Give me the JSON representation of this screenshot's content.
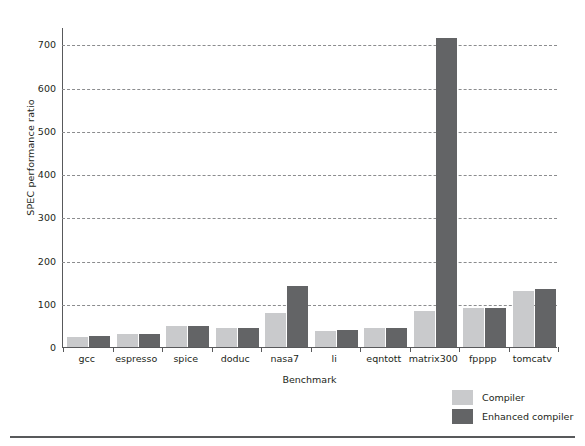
{
  "chart_data": {
    "type": "bar",
    "title": "",
    "xlabel": "Benchmark",
    "ylabel": "SPEC performance ratio",
    "categories": [
      "gcc",
      "espresso",
      "spice",
      "doduc",
      "nasa7",
      "li",
      "eqntott",
      "matrix300",
      "fpppp",
      "tomcatv"
    ],
    "series": [
      {
        "name": "Compiler",
        "color": "#c9cacc",
        "values": [
          24,
          30,
          49,
          44,
          78,
          38,
          43,
          84,
          90,
          130
        ]
      },
      {
        "name": "Enhanced compiler",
        "color": "#636466",
        "values": [
          25,
          29,
          49,
          45,
          142,
          39,
          45,
          715,
          90,
          135
        ]
      }
    ],
    "ylim": [
      0,
      700
    ],
    "yticks": [
      0,
      100,
      200,
      300,
      400,
      500,
      600,
      700
    ],
    "ytick_labels": [
      "0",
      "100",
      "200",
      "300",
      "400",
      "500",
      "600",
      "700"
    ],
    "grid": "horizontal-dashed",
    "legend_position": "bottom-right",
    "ymax_render": 740
  },
  "legend": {
    "items": [
      {
        "label": "Compiler",
        "swatch": "#c9cacc"
      },
      {
        "label": "Enhanced compiler",
        "swatch": "#636466"
      }
    ]
  },
  "axes": {
    "y_title": "SPEC performance ratio",
    "x_title": "Benchmark"
  }
}
